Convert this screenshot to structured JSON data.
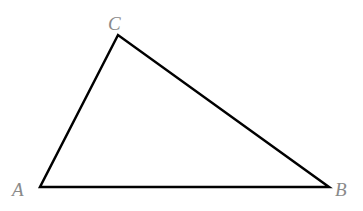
{
  "diagram": {
    "type": "triangle",
    "vertices": [
      {
        "name": "A",
        "x": 40,
        "y": 187
      },
      {
        "name": "B",
        "x": 329,
        "y": 187
      },
      {
        "name": "C",
        "x": 118,
        "y": 35
      }
    ],
    "labels": {
      "A": "A",
      "B": "B",
      "C": "C"
    },
    "colors": {
      "stroke": "#000000",
      "label": "#8a8a8a",
      "background": "#ffffff"
    },
    "stroke_width": 2.5
  }
}
